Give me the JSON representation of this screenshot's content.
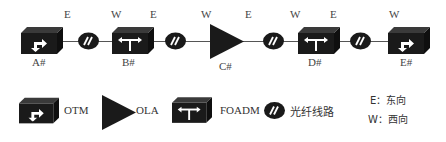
{
  "diagram": {
    "nodes": [
      {
        "id": "A",
        "label": "A#",
        "type": "OTM"
      },
      {
        "id": "B",
        "label": "B#",
        "type": "FOADM"
      },
      {
        "id": "C",
        "label": "C#",
        "type": "OLA"
      },
      {
        "id": "D",
        "label": "D#",
        "type": "FOADM"
      },
      {
        "id": "E",
        "label": "E#",
        "type": "OTM"
      }
    ],
    "direction_labels": [
      "E",
      "W",
      "E",
      "W",
      "E",
      "W",
      "E",
      "W"
    ],
    "links": [
      {
        "from": "A#",
        "to": "B#",
        "type": "fiber"
      },
      {
        "from": "B#",
        "to": "C#",
        "type": "fiber"
      },
      {
        "from": "C#",
        "to": "D#",
        "type": "fiber"
      },
      {
        "from": "D#",
        "to": "E#",
        "type": "fiber"
      }
    ]
  },
  "legend": {
    "otm": "OTM",
    "ola": "OLA",
    "foadm": "FOADM",
    "fiber": "光纤线路",
    "east": "E：东向",
    "west": "W：西向"
  },
  "colors": {
    "icon_fill": "#1a1a1a",
    "icon_top": "#2e2e2e",
    "line": "#555555",
    "background": "#ffffff"
  }
}
